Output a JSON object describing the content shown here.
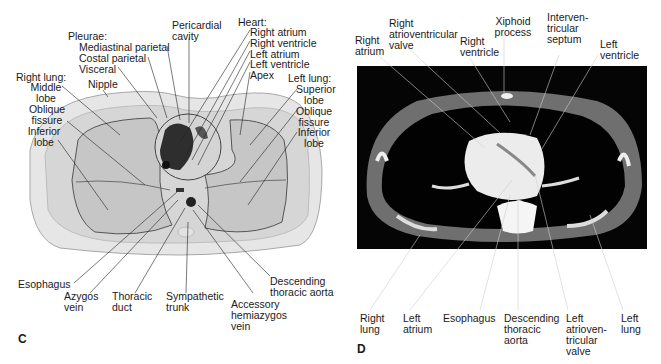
{
  "panel_c": {
    "letter": "C",
    "labels": {
      "pleurae_header": "Pleurae:",
      "mediastinal_parietal": "Mediastinal parietal",
      "costal_parietal": "Costal parietal",
      "visceral": "Visceral",
      "pericardial_cavity": "Pericardial\ncavity",
      "heart_header": "Heart:",
      "right_atrium": "Right atrium",
      "right_ventricle": "Right ventricle",
      "left_atrium": "Left atrium",
      "left_ventricle": "Left ventricle",
      "apex": "Apex",
      "right_lung_header": "Right lung:",
      "middle_lobe": "Middle\nlobe",
      "oblique_fissure_r": "Oblique\nfissure",
      "inferior_lobe_r": "Inferior\nlobe",
      "nipple": "Nipple",
      "left_lung_header": "Left lung:",
      "superior_lobe": "Superior\nlobe",
      "oblique_fissure_l": "Oblique\nfissure",
      "inferior_lobe_l": "Inferior\nlobe",
      "esophagus": "Esophagus",
      "azygos_vein": "Azygos\nvein",
      "thoracic_duct": "Thoracic\nduct",
      "sympathetic_trunk": "Sympathetic\ntrunk",
      "accessory_hemiazygos_vein": "Accessory\nhemiazygos\nvein",
      "descending_thoracic_aorta": "Descending\nthoracic aorta"
    }
  },
  "panel_d": {
    "letter": "D",
    "labels": {
      "right_atrium": "Right\natrium",
      "right_av_valve": "Right\natrioventricular\nvalve",
      "right_ventricle": "Right\nventricle",
      "xiphoid_process": "Xiphoid\nprocess",
      "interventricular_septum": "Interven-\ntricular\nseptum",
      "left_ventricle": "Left\nventricle",
      "right_lung": "Right\nlung",
      "left_atrium": "Left\natrium",
      "esophagus": "Esophagus",
      "descending_thoracic_aorta": "Descending\nthoracic\naorta",
      "left_av_valve": "Left\natrioven-\ntricular\nvalve",
      "left_lung": "Left\nlung"
    }
  },
  "colors": {
    "body_outline": "#d9d9d9",
    "lung_fill": "#c9c9c9",
    "ct_background": "#000000",
    "ct_soft_tissue": "#7d7d7d",
    "ct_bright": "#f2f2f2"
  }
}
